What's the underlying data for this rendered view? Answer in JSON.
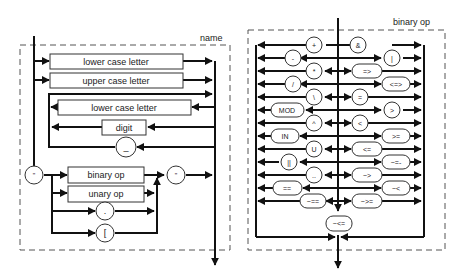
{
  "left_diagram": {
    "title": "name",
    "boxes": {
      "lower1": "lower case letter",
      "upper": "upper case letter",
      "lower2": "lower case letter",
      "digit": "digit",
      "binop": "binary op",
      "unop": "unary op"
    },
    "circles": {
      "underscore": "_",
      "quote_open": "\"",
      "quote_close": "\"",
      "dot": ".",
      "bracket": "["
    }
  },
  "right_diagram": {
    "title": "binary op",
    "left_ops": [
      "+",
      "-",
      "*",
      "/",
      "\\",
      "MOD",
      "^",
      "IN",
      "U",
      "||",
      "..",
      "==",
      "~=="
    ],
    "right_ops": [
      "&",
      "|",
      "=>",
      "<=>",
      "=",
      ">",
      "<",
      ">=",
      "<=",
      "~=-",
      "~>",
      "~<",
      "~>="
    ],
    "bottom_op": "~<="
  },
  "colors": {
    "line": "#111111",
    "dash": "#555555",
    "text": "#222222",
    "background": "#ffffff"
  }
}
